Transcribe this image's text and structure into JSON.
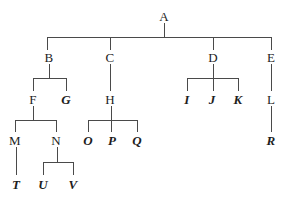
{
  "diagram": {
    "type": "hierarchical-tree",
    "title": "",
    "background_color": "#ffffff",
    "line_color": "#4a4a4a",
    "text_color": "#1d1d1d",
    "width": 285,
    "height": 208,
    "styles": {
      "plain": "upright serif",
      "emph": "bold italic serif"
    },
    "levels": [
      {
        "name": "level-1",
        "y": 16,
        "labels": [
          "A"
        ]
      },
      {
        "name": "level-2",
        "y": 57,
        "labels": [
          "B",
          "C",
          "D",
          "E"
        ]
      },
      {
        "name": "level-3",
        "y": 99,
        "labels": [
          "F",
          "G",
          "H",
          "I",
          "J",
          "K",
          "L"
        ]
      },
      {
        "name": "level-4",
        "y": 140,
        "labels": [
          "M",
          "N",
          "O",
          "P",
          "Q",
          "R"
        ]
      },
      {
        "name": "level-5",
        "y": 184,
        "labels": [
          "T",
          "U",
          "V"
        ]
      }
    ],
    "nodes": [
      {
        "id": "A",
        "label": "A",
        "style": "plain",
        "x": 164,
        "y": 16
      },
      {
        "id": "B",
        "label": "B",
        "style": "plain",
        "x": 49,
        "y": 57
      },
      {
        "id": "C",
        "label": "C",
        "style": "plain",
        "x": 110,
        "y": 57
      },
      {
        "id": "D",
        "label": "D",
        "style": "plain",
        "x": 213,
        "y": 57
      },
      {
        "id": "E",
        "label": "E",
        "style": "plain",
        "x": 271,
        "y": 57
      },
      {
        "id": "F",
        "label": "F",
        "style": "plain",
        "x": 33,
        "y": 99
      },
      {
        "id": "G",
        "label": "G",
        "style": "emph",
        "x": 66,
        "y": 99
      },
      {
        "id": "H",
        "label": "H",
        "style": "plain",
        "x": 110,
        "y": 99
      },
      {
        "id": "I",
        "label": "I",
        "style": "emph",
        "x": 187,
        "y": 99
      },
      {
        "id": "J",
        "label": "J",
        "style": "emph",
        "x": 212,
        "y": 99
      },
      {
        "id": "K",
        "label": "K",
        "style": "emph",
        "x": 238,
        "y": 99
      },
      {
        "id": "L",
        "label": "L",
        "style": "plain",
        "x": 271,
        "y": 99
      },
      {
        "id": "M",
        "label": "M",
        "style": "plain",
        "x": 15,
        "y": 140
      },
      {
        "id": "N",
        "label": "N",
        "style": "plain",
        "x": 56,
        "y": 140
      },
      {
        "id": "O",
        "label": "O",
        "style": "emph",
        "x": 88,
        "y": 140
      },
      {
        "id": "P",
        "label": "P",
        "style": "emph",
        "x": 112,
        "y": 140
      },
      {
        "id": "Q",
        "label": "Q",
        "style": "emph",
        "x": 137,
        "y": 140
      },
      {
        "id": "R",
        "label": "R",
        "style": "emph",
        "x": 271,
        "y": 140
      },
      {
        "id": "T",
        "label": "T",
        "style": "emph",
        "x": 16,
        "y": 184
      },
      {
        "id": "U",
        "label": "U",
        "style": "emph",
        "x": 43,
        "y": 184
      },
      {
        "id": "V",
        "label": "V",
        "style": "emph",
        "x": 73,
        "y": 184
      }
    ],
    "connections": [
      {
        "parent": "A",
        "children": [
          "B",
          "C",
          "D",
          "E"
        ]
      },
      {
        "parent": "B",
        "children": [
          "F",
          "G"
        ]
      },
      {
        "parent": "C",
        "children": [
          "H"
        ]
      },
      {
        "parent": "D",
        "children": [
          "I",
          "J",
          "K"
        ]
      },
      {
        "parent": "E",
        "children": [
          "L"
        ]
      },
      {
        "parent": "F",
        "children": [
          "M",
          "N"
        ]
      },
      {
        "parent": "H",
        "children": [
          "O",
          "P",
          "Q"
        ]
      },
      {
        "parent": "L",
        "children": [
          "R"
        ]
      },
      {
        "parent": "M",
        "children": [
          "T"
        ]
      },
      {
        "parent": "N",
        "children": [
          "U",
          "V"
        ]
      }
    ],
    "edges": [
      {
        "name": "edge-a-stem",
        "kind": "v",
        "x": 164,
        "y": 23,
        "length": 14
      },
      {
        "name": "edge-a-bus",
        "kind": "h",
        "x": 47,
        "y": 37,
        "length": 225
      },
      {
        "name": "edge-b-drop",
        "kind": "v",
        "x": 47,
        "y": 37,
        "length": 13
      },
      {
        "name": "edge-c-drop",
        "kind": "v",
        "x": 110,
        "y": 37,
        "length": 13
      },
      {
        "name": "edge-d-drop",
        "kind": "v",
        "x": 213,
        "y": 37,
        "length": 13
      },
      {
        "name": "edge-e-drop",
        "kind": "v",
        "x": 271,
        "y": 37,
        "length": 13
      },
      {
        "name": "edge-b-stem",
        "kind": "v",
        "x": 49,
        "y": 64,
        "length": 14
      },
      {
        "name": "edge-b-bus",
        "kind": "h",
        "x": 33,
        "y": 78,
        "length": 34
      },
      {
        "name": "edge-f-drop",
        "kind": "v",
        "x": 33,
        "y": 78,
        "length": 13
      },
      {
        "name": "edge-g-drop",
        "kind": "v",
        "x": 66,
        "y": 78,
        "length": 13
      },
      {
        "name": "edge-c-h",
        "kind": "v",
        "x": 110,
        "y": 64,
        "length": 27
      },
      {
        "name": "edge-d-stem",
        "kind": "v",
        "x": 213,
        "y": 64,
        "length": 14
      },
      {
        "name": "edge-d-bus",
        "kind": "h",
        "x": 187,
        "y": 78,
        "length": 52
      },
      {
        "name": "edge-i-drop",
        "kind": "v",
        "x": 187,
        "y": 78,
        "length": 13
      },
      {
        "name": "edge-j-drop",
        "kind": "v",
        "x": 213,
        "y": 78,
        "length": 13
      },
      {
        "name": "edge-k-drop",
        "kind": "v",
        "x": 238,
        "y": 78,
        "length": 13
      },
      {
        "name": "edge-e-l",
        "kind": "v",
        "x": 271,
        "y": 64,
        "length": 27
      },
      {
        "name": "edge-f-stem",
        "kind": "v",
        "x": 33,
        "y": 106,
        "length": 14
      },
      {
        "name": "edge-f-bus",
        "kind": "h",
        "x": 15,
        "y": 120,
        "length": 42
      },
      {
        "name": "edge-m-drop",
        "kind": "v",
        "x": 15,
        "y": 120,
        "length": 12
      },
      {
        "name": "edge-n-drop",
        "kind": "v",
        "x": 56,
        "y": 120,
        "length": 12
      },
      {
        "name": "edge-h-stem",
        "kind": "v",
        "x": 111,
        "y": 106,
        "length": 26
      },
      {
        "name": "edge-h-bus",
        "kind": "h",
        "x": 88,
        "y": 120,
        "length": 49
      },
      {
        "name": "edge-o-drop",
        "kind": "v",
        "x": 88,
        "y": 120,
        "length": 12
      },
      {
        "name": "edge-q-drop",
        "kind": "v",
        "x": 137,
        "y": 120,
        "length": 12
      },
      {
        "name": "edge-l-r",
        "kind": "v",
        "x": 271,
        "y": 106,
        "length": 26
      },
      {
        "name": "edge-m-t",
        "kind": "v",
        "x": 16,
        "y": 147,
        "length": 28
      },
      {
        "name": "edge-n-stem",
        "kind": "v",
        "x": 57,
        "y": 147,
        "length": 15
      },
      {
        "name": "edge-n-bus",
        "kind": "h",
        "x": 43,
        "y": 162,
        "length": 31
      },
      {
        "name": "edge-u-drop",
        "kind": "v",
        "x": 43,
        "y": 162,
        "length": 13
      },
      {
        "name": "edge-v-drop",
        "kind": "v",
        "x": 73,
        "y": 162,
        "length": 13
      }
    ]
  }
}
